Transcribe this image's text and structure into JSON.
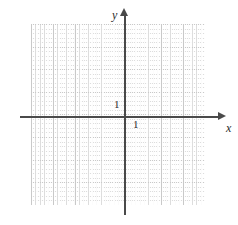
{
  "figure": {
    "kind": "cartesian-coordinate-grid",
    "width": 238,
    "height": 225,
    "background_color": "#ffffff"
  },
  "axes": {
    "x": {
      "label": "x",
      "unit_tick_label": "1",
      "arrow": "right-arrowhead",
      "color": "#4a4a4a"
    },
    "y": {
      "label": "y",
      "unit_tick_label": "1",
      "arrow": "up-arrowhead",
      "color": "#4a4a4a"
    },
    "origin_label": ""
  },
  "grid": {
    "major_color": "#c9c9c9",
    "minor_color": "#dddddd",
    "major_cells_x": 8,
    "major_cells_y": 8,
    "minor_per_major": 5,
    "style": "dotted-graph-paper"
  },
  "chart_data": {
    "type": "scatter",
    "title": "",
    "subtitle": "",
    "xlabel": "x",
    "ylabel": "y",
    "xlim": [
      -4.4,
      3.6
    ],
    "ylim": [
      -4.1,
      4.2
    ],
    "x_tick_labels": [
      "1"
    ],
    "y_tick_labels": [
      "1"
    ],
    "x_ticks": [
      1
    ],
    "y_ticks": [
      1
    ],
    "grid": true,
    "legend": null,
    "series": [],
    "annotations": []
  }
}
